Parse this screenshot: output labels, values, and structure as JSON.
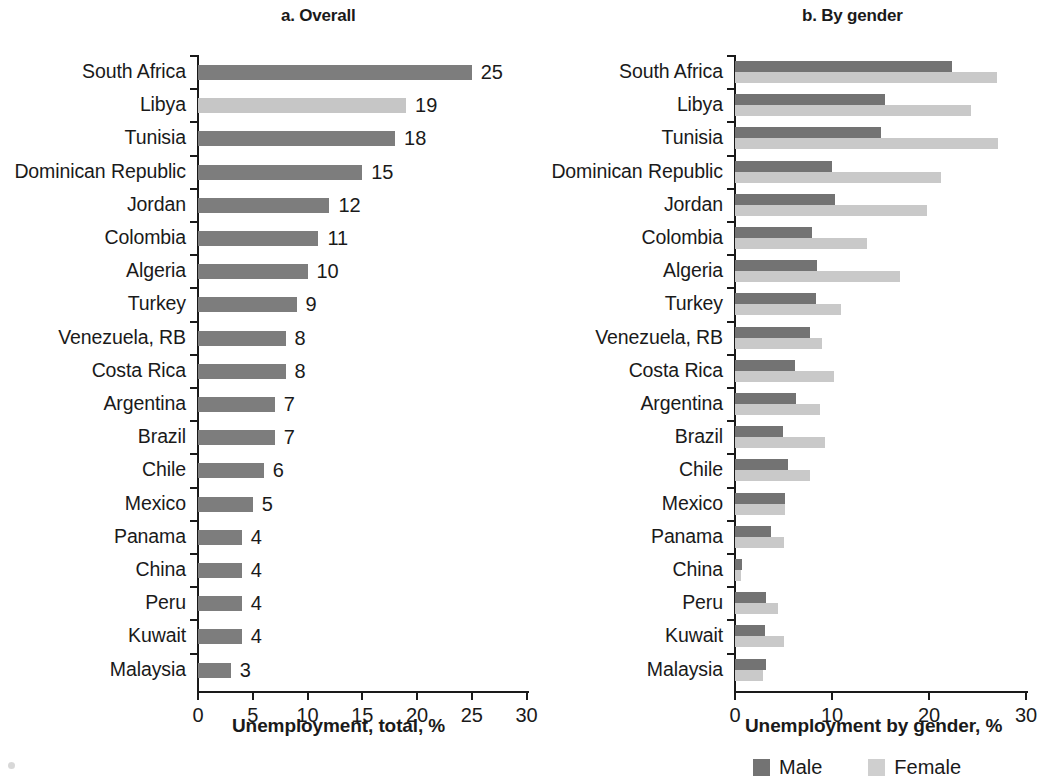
{
  "figure": {
    "panels": [
      {
        "id": "panel-a",
        "title": "a. Overall",
        "axis_title": "Unemployment, total, %"
      },
      {
        "id": "panel-b",
        "title": "b. By gender",
        "axis_title": "Unemployment by gender, %"
      }
    ],
    "legend": {
      "male_label": "Male",
      "female_label": "Female"
    }
  },
  "colors": {
    "dark_gray": "#7d7d7d",
    "light_gray": "#c6c6c6",
    "male": "#737373",
    "female": "#c9c9c9",
    "axis": "#1a1a1a"
  },
  "chart_data": [
    {
      "type": "bar",
      "orientation": "horizontal",
      "title": "a. Overall",
      "xlabel": "Unemployment, total, %",
      "ylabel": "",
      "xlim": [
        0,
        30
      ],
      "xticks": [
        0,
        5,
        10,
        15,
        20,
        25,
        30
      ],
      "xtick_labels": [
        "0",
        "5",
        "10",
        "15",
        "20",
        "25",
        "30"
      ],
      "grid": false,
      "legend": "none",
      "categories": [
        "South Africa",
        "Libya",
        "Tunisia",
        "Dominican Republic",
        "Jordan",
        "Colombia",
        "Algeria",
        "Turkey",
        "Venezuela, RB",
        "Costa Rica",
        "Argentina",
        "Brazil",
        "Chile",
        "Mexico",
        "Panama",
        "China",
        "Peru",
        "Kuwait",
        "Malaysia"
      ],
      "values": [
        25,
        19,
        18,
        15,
        12,
        11,
        10,
        9,
        8,
        8,
        7,
        7,
        6,
        5,
        4,
        4,
        4,
        4,
        3
      ],
      "data_labels": [
        "25",
        "19",
        "18",
        "15",
        "12",
        "11",
        "10",
        "9",
        "8",
        "8",
        "7",
        "7",
        "6",
        "5",
        "4",
        "4",
        "4",
        "4",
        "3"
      ],
      "bar_shades": [
        "dark",
        "light",
        "dark",
        "dark",
        "dark",
        "dark",
        "dark",
        "dark",
        "dark",
        "dark",
        "dark",
        "dark",
        "dark",
        "dark",
        "dark",
        "dark",
        "dark",
        "dark",
        "dark"
      ]
    },
    {
      "type": "bar",
      "orientation": "horizontal",
      "title": "b. By gender",
      "xlabel": "Unemployment by gender, %",
      "ylabel": "",
      "xlim": [
        0,
        30
      ],
      "xticks": [
        0,
        10,
        20,
        30
      ],
      "xtick_labels": [
        "0",
        "10",
        "20",
        "30"
      ],
      "grid": false,
      "legend": "bottom",
      "categories": [
        "South Africa",
        "Libya",
        "Tunisia",
        "Dominican Republic",
        "Jordan",
        "Colombia",
        "Algeria",
        "Turkey",
        "Venezuela, RB",
        "Costa Rica",
        "Argentina",
        "Brazil",
        "Chile",
        "Mexico",
        "Panama",
        "China",
        "Peru",
        "Kuwait",
        "Malaysia"
      ],
      "series": [
        {
          "name": "Male",
          "values": [
            22.4,
            15.5,
            15.0,
            10.0,
            10.3,
            7.9,
            8.5,
            8.4,
            7.7,
            6.2,
            6.3,
            4.9,
            5.5,
            5.2,
            3.7,
            0.7,
            3.2,
            3.1,
            3.2
          ]
        },
        {
          "name": "Female",
          "values": [
            27.0,
            24.3,
            27.1,
            21.2,
            19.8,
            13.6,
            17.0,
            10.9,
            9.0,
            10.2,
            8.8,
            9.3,
            7.7,
            5.2,
            5.0,
            0.6,
            4.4,
            5.0,
            2.9
          ]
        }
      ]
    }
  ]
}
